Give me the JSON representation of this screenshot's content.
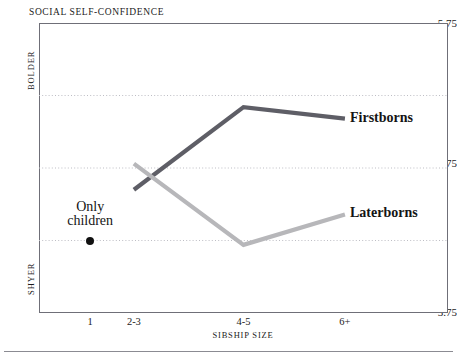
{
  "chart_data": {
    "type": "line",
    "title": "SOCIAL SELF-CONFIDENCE",
    "xlabel": "SIBSHIP SIZE",
    "ylabel": "",
    "categories": [
      "1",
      "2-3",
      "4-5",
      "6+"
    ],
    "ylim": [
      3.75,
      5.75
    ],
    "yticks": [
      "3.75",
      "4.75",
      "5.75"
    ],
    "ytick_values": [
      3.75,
      4.75,
      5.75
    ],
    "gridlines": [
      4.25,
      4.75,
      5.25
    ],
    "grid": true,
    "legend_position": "inline-right",
    "y_axis_poles": {
      "high": "BOLDER",
      "low": "SHYER"
    },
    "series": [
      {
        "name": "Firstborns",
        "color": "#5e5e66",
        "x": [
          "2-3",
          "4-5",
          "6+"
        ],
        "values": [
          4.6,
          5.17,
          5.09
        ]
      },
      {
        "name": "Laterborns",
        "color": "#b7b7ba",
        "x": [
          "2-3",
          "4-5",
          "6+"
        ],
        "values": [
          4.78,
          4.22,
          4.43
        ]
      }
    ],
    "annotations": [
      {
        "name": "only-children",
        "text_line1": "Only",
        "text_line2": "children",
        "x": "1",
        "value": 4.25,
        "marker": "filled-circle",
        "marker_color": "#111111"
      }
    ]
  },
  "axis": {
    "y_top_label": "5.75",
    "y_mid_label": "4.75",
    "y_bottom_label": "3.75",
    "y_high_word": "BOLDER",
    "y_low_word": "SHYER",
    "x_labels": [
      "1",
      "2-3",
      "4-5",
      "6+"
    ],
    "x_title": "SIBSHIP SIZE"
  },
  "labels": {
    "title": "SOCIAL SELF-CONFIDENCE",
    "firstborns": "Firstborns",
    "laterborns": "Laterborns",
    "only_children_line1": "Only",
    "only_children_line2": "children"
  },
  "colors": {
    "firstborns_line": "#5e5e66",
    "laterborns_line": "#b7b7ba",
    "frame": "#6f6f78",
    "gridline": "#bdbdc4",
    "text": "#1b1b1b",
    "dot": "#111111",
    "rule": "#8b8b92"
  }
}
